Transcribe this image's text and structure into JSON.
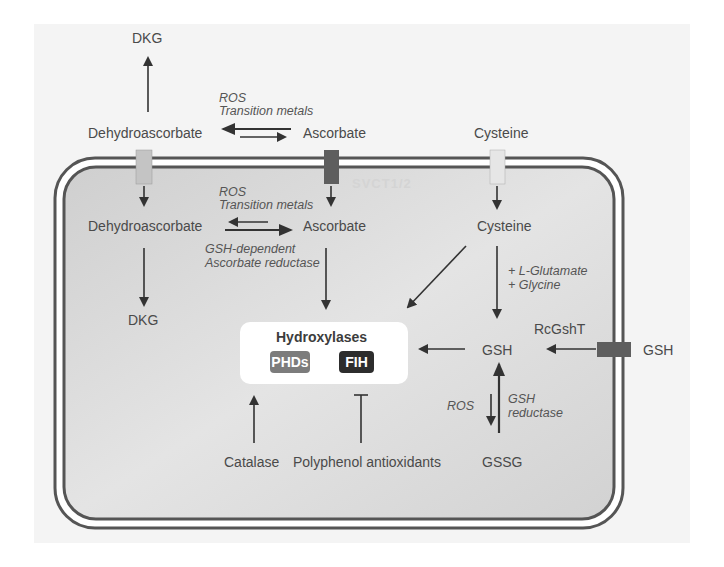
{
  "figure": {
    "colors": {
      "panel_bg": "#f4f4f4",
      "cell_fill": "#d6d6d6",
      "membrane": "#555555",
      "arrow": "#333333",
      "transporter_light": "#c4c4c4",
      "transporter_dark": "#5e5e5e",
      "transporter_cys": "#e6e6e6",
      "phds_badge": "#7c7c7c",
      "fih_badge": "#2d2d2d"
    },
    "extracellular": {
      "dkg": "DKG",
      "dehydroascorbate": "Dehydroascorbate",
      "ascorbate": "Ascorbate",
      "cysteine": "Cysteine",
      "gsh": "GSH",
      "redox_label_1": "ROS",
      "redox_label_2": "Transition metals"
    },
    "membrane": {
      "svct_label": "SVCT1/2",
      "rcgsht_label": "RcGshT"
    },
    "intracellular": {
      "dehydroascorbate": "Dehydroascorbate",
      "ascorbate": "Ascorbate",
      "cysteine": "Cysteine",
      "dkg": "DKG",
      "redox_label_1": "ROS",
      "redox_label_2": "Transition metals",
      "reductase_label_1": "GSH-dependent",
      "reductase_label_2": "Ascorbate reductase",
      "glutamate": "+ L-Glutamate",
      "glycine": "+ Glycine",
      "gsh": "GSH",
      "gssg": "GSSG",
      "ros": "ROS",
      "gsh_reductase_1": "GSH",
      "gsh_reductase_2": "reductase",
      "catalase": "Catalase",
      "polyphenol": "Polyphenol antioxidants"
    },
    "hydroxylases": {
      "title": "Hydroxylases",
      "phds": "PHDs",
      "fih": "FIH"
    }
  }
}
